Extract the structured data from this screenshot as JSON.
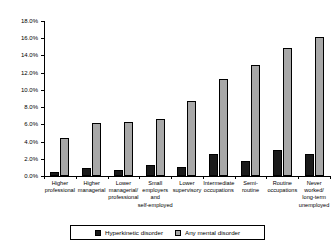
{
  "chart_data": {
    "type": "bar",
    "title": "",
    "xlabel": "",
    "ylabel": "",
    "ylim": [
      0,
      18
    ],
    "yticks": [
      "0.0%",
      "2.0%",
      "4.0%",
      "6.0%",
      "8.0%",
      "10.0%",
      "12.0%",
      "14.0%",
      "16.0%",
      "18.0%"
    ],
    "ytick_values": [
      0,
      2,
      4,
      6,
      8,
      10,
      12,
      14,
      16,
      18
    ],
    "grid": false,
    "legend_position": "bottom",
    "categories": [
      "Higher professional",
      "Higher managerial",
      "Lower managerial/ professional",
      "Small employers and self-employed",
      "Lower supervisory",
      "Intermediate occupations",
      "Semi- routine",
      "Routine occupations",
      "Never worked/ long-term unemployed"
    ],
    "category_lines": [
      [
        "Higher",
        "professional"
      ],
      [
        "Higher",
        "managerial"
      ],
      [
        "Lower",
        "managerial/",
        "professional"
      ],
      [
        "Small",
        "employers",
        "and",
        "self-employed"
      ],
      [
        "Lower",
        "supervisory"
      ],
      [
        "Intermediate",
        "occupations"
      ],
      [
        "Semi-",
        "routine"
      ],
      [
        "Routine",
        "occupations"
      ],
      [
        "Never",
        "worked/",
        "long-term",
        "unemployed"
      ]
    ],
    "series": [
      {
        "name": "Hyperkinetic disorder",
        "color": "#1a1a1a",
        "values": [
          0.5,
          0.9,
          0.7,
          1.3,
          1.0,
          2.6,
          1.7,
          3.0,
          2.6
        ]
      },
      {
        "name": "Any mental disorder",
        "color": "#a8a8a8",
        "values": [
          4.4,
          6.2,
          6.3,
          6.6,
          8.7,
          11.3,
          12.9,
          14.9,
          16.1
        ]
      }
    ]
  },
  "legend": {
    "items": [
      {
        "label": "Hyperkinetic disorder",
        "swatch": "black"
      },
      {
        "label": "Any mental disorder",
        "swatch": "gray"
      }
    ]
  }
}
